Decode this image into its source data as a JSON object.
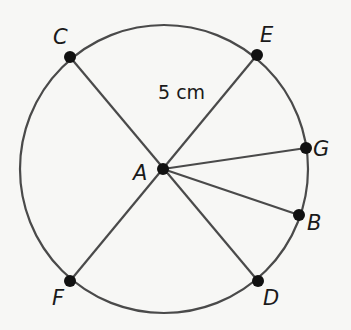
{
  "diagram": {
    "type": "circle-with-radii",
    "colors": {
      "stroke": "#4a4a4a",
      "point": "#111111",
      "background": "#f7f7f5",
      "text": "#1a1a1a"
    },
    "circle": {
      "cx": 164,
      "cy": 169,
      "r": 144
    },
    "center": {
      "label": "A",
      "x": 163,
      "y": 169
    },
    "measurement_label": "5 cm",
    "points": [
      {
        "label": "C",
        "x": 70,
        "y": 57
      },
      {
        "label": "E",
        "x": 257,
        "y": 55
      },
      {
        "label": "G",
        "x": 306,
        "y": 148
      },
      {
        "label": "B",
        "x": 299,
        "y": 215
      },
      {
        "label": "D",
        "x": 258,
        "y": 281
      },
      {
        "label": "F",
        "x": 70,
        "y": 281
      }
    ],
    "segments": [
      {
        "from": "C",
        "to": "D"
      },
      {
        "from": "E",
        "to": "F"
      },
      {
        "from": "A",
        "to": "G"
      },
      {
        "from": "A",
        "to": "B"
      }
    ]
  }
}
